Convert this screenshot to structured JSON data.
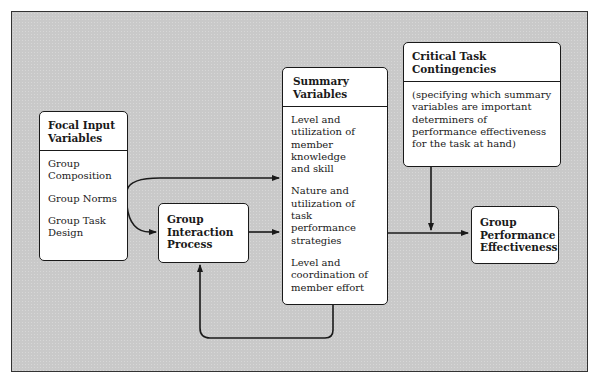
{
  "diagram": {
    "boxes": {
      "focal_input": {
        "title": "Focal Input Variables",
        "items": [
          "Group\nComposition",
          "Group Norms",
          "Group Task\nDesign"
        ]
      },
      "interaction": {
        "title": "Group\nInteraction\nProcess"
      },
      "summary": {
        "title": "Summary Variables",
        "items": [
          "Level and\nutilization of\nmember\nknowledge\nand skill",
          "Nature and\nutilization of\ntask performance\nstrategies",
          "Level and\ncoordination of\nmember effort"
        ]
      },
      "contingencies": {
        "title": "Critical Task Contingencies",
        "body": "(specifying which summary variables are important determiners of performance effectiveness for the task at hand)"
      },
      "effectiveness": {
        "title": "Group\nPerformance\nEffectiveness"
      }
    },
    "edges": [
      {
        "from": "Focal Input Variables",
        "to": "Summary Variables"
      },
      {
        "from": "Focal Input Variables",
        "to": "Group Interaction Process"
      },
      {
        "from": "Group Interaction Process",
        "to": "Summary Variables"
      },
      {
        "from": "Summary Variables",
        "to": "Group Interaction Process",
        "type": "feedback"
      },
      {
        "from": "Summary Variables",
        "to": "Group Performance Effectiveness"
      },
      {
        "from": "Critical Task Contingencies",
        "to": "Summary Variables -> Group Performance Effectiveness edge"
      }
    ],
    "colors": {
      "background": "#c9c9c9",
      "box_fill": "#ffffff",
      "stroke": "#1a1a1a"
    }
  }
}
